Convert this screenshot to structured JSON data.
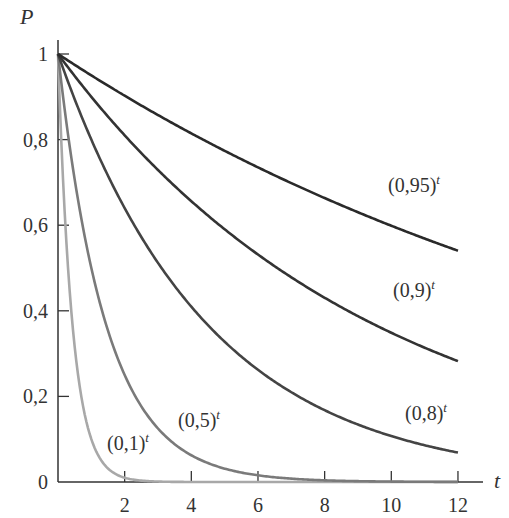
{
  "chart_data": {
    "type": "line",
    "title": "",
    "xlabel": "t",
    "ylabel": "P",
    "xlim": [
      0,
      12.6
    ],
    "ylim": [
      0,
      1.05
    ],
    "grid": false,
    "x_ticks": [
      "2",
      "4",
      "6",
      "8",
      "10",
      "12"
    ],
    "y_ticks": [
      "0",
      "0,2",
      "0,4",
      "0,6",
      "0,8",
      "1"
    ],
    "series": [
      {
        "name": "(0,95)^t",
        "base": 0.95,
        "color": "#2a2a2a"
      },
      {
        "name": "(0,9)^t",
        "base": 0.9,
        "color": "#333333"
      },
      {
        "name": "(0,8)^t",
        "base": 0.8,
        "color": "#444444"
      },
      {
        "name": "(0,5)^t",
        "base": 0.5,
        "color": "#7a7a7a"
      },
      {
        "name": "(0,1)^t",
        "base": 0.1,
        "color": "#a8a8a8"
      }
    ],
    "x": [
      0,
      2,
      4,
      6,
      8,
      10,
      12
    ],
    "values_sampled": {
      "(0,95)^t": [
        1,
        0.903,
        0.815,
        0.735,
        0.663,
        0.599,
        0.54
      ],
      "(0,9)^t": [
        1,
        0.81,
        0.656,
        0.531,
        0.43,
        0.349,
        0.282
      ],
      "(0,8)^t": [
        1,
        0.64,
        0.41,
        0.262,
        0.168,
        0.107,
        0.069
      ],
      "(0,5)^t": [
        1,
        0.25,
        0.063,
        0.016,
        0.004,
        0.001,
        0.0
      ],
      "(0,1)^t": [
        1,
        0.01,
        0.0,
        0.0,
        0.0,
        0.0,
        0.0
      ]
    }
  },
  "labels": {
    "y_axis": "P",
    "x_axis": "t",
    "series": [
      {
        "base": "(0,95)",
        "exp": "t"
      },
      {
        "base": "(0,9)",
        "exp": "t"
      },
      {
        "base": "(0,8)",
        "exp": "t"
      },
      {
        "base": "(0,5)",
        "exp": "t"
      },
      {
        "base": "(0,1)",
        "exp": "t"
      }
    ]
  }
}
